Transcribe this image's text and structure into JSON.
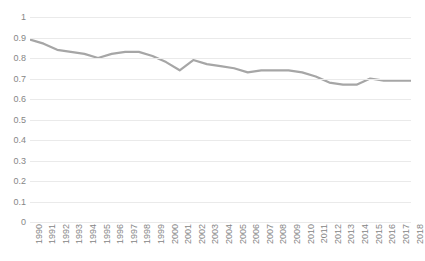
{
  "chart_data": {
    "type": "line",
    "title": "",
    "xlabel": "",
    "ylabel": "",
    "ylim": [
      0,
      1
    ],
    "ytick_step": 0.1,
    "grid": true,
    "legend": "none",
    "line_color": "#a6a6a6",
    "categories": [
      "1990",
      "1991",
      "1992",
      "1993",
      "1994",
      "1995",
      "1996",
      "1997",
      "1998",
      "1999",
      "2000",
      "2001",
      "2002",
      "2003",
      "2004",
      "2005",
      "2006",
      "2007",
      "2008",
      "2009",
      "2010",
      "2011",
      "2012",
      "2013",
      "2014",
      "2015",
      "2016",
      "2017",
      "2018"
    ],
    "values": [
      0.89,
      0.87,
      0.84,
      0.83,
      0.82,
      0.8,
      0.82,
      0.83,
      0.83,
      0.81,
      0.78,
      0.74,
      0.79,
      0.77,
      0.76,
      0.75,
      0.73,
      0.74,
      0.74,
      0.74,
      0.73,
      0.71,
      0.68,
      0.67,
      0.67,
      0.7,
      0.69,
      0.69,
      0.69
    ],
    "ytick_labels": [
      "1",
      "0.9",
      "0.8",
      "0.7",
      "0.6",
      "0.5",
      "0.4",
      "0.3",
      "0.2",
      "0.1",
      "0"
    ]
  }
}
